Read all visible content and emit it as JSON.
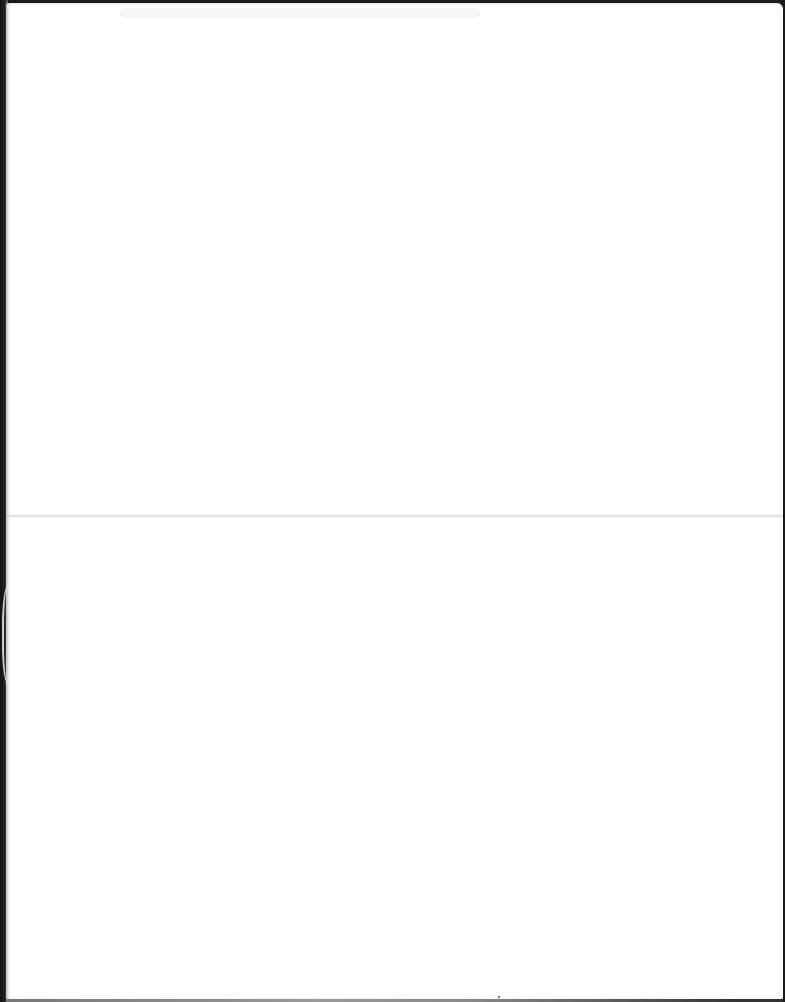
{
  "document": {
    "type": "scanned-page",
    "content": "",
    "description": "Blank scanned sheet of paper with horizontal fold line"
  },
  "colors": {
    "paper": "#ffffff",
    "scanner_bed": "#1a1a1a",
    "fold_shadow": "#bebebe"
  }
}
